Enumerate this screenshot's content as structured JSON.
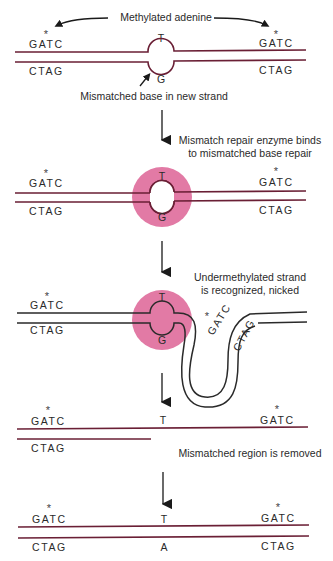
{
  "colors": {
    "strand": "#6a1f35",
    "strand_dark": "#2a2a2a",
    "enzyme": "#e27aa5",
    "text": "#2a2a2a"
  },
  "steps": [
    {
      "id": "step-1",
      "top_label": "Methylated adenine",
      "left_top": "GATC",
      "left_bottom": "CTAG",
      "right_top": "GATC",
      "right_bottom": "CTAG",
      "mismatch_top": "T",
      "mismatch_bottom": "G",
      "caption": "Mismatched base in new strand",
      "methyl_marker": "*"
    },
    {
      "id": "step-2",
      "caption_line1": "Mismatch repair enzyme binds",
      "caption_line2": "to mismatched base repair",
      "left_top": "GATC",
      "left_bottom": "CTAG",
      "right_top": "GATC",
      "right_bottom": "CTAG",
      "mismatch_top": "T",
      "mismatch_bottom": "G",
      "methyl_marker": "*"
    },
    {
      "id": "step-3",
      "caption_line1": "Undermethylated strand",
      "caption_line2": "is recognized, nicked",
      "left_top": "GATC",
      "left_bottom": "CTAG",
      "loop_top": "GATC",
      "loop_bottom": "CTAG",
      "mismatch_top": "T",
      "mismatch_bottom": "G",
      "methyl_marker": "*"
    },
    {
      "id": "step-4",
      "caption": "Mismatched region is removed",
      "left_top": "GATC",
      "left_bottom": "CTAG",
      "right_top": "GATC",
      "center_top": "T",
      "methyl_marker": "*"
    },
    {
      "id": "step-5",
      "left_top": "GATC",
      "left_bottom": "CTAG",
      "right_top": "GATC",
      "right_bottom": "CTAG",
      "center_top": "T",
      "center_bottom": "A",
      "methyl_marker": "*"
    }
  ]
}
